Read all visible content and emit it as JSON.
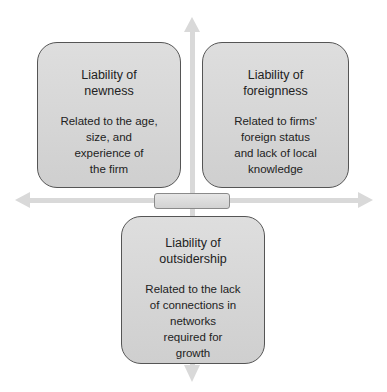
{
  "diagram": {
    "type": "quadrant-axes",
    "colors": {
      "axis": "#d9d9d9",
      "box_fill": "#d6d6d6",
      "box_border": "#555555"
    },
    "boxes": [
      {
        "position": "top-left",
        "title_lines": [
          "Liability of",
          "newness"
        ],
        "desc_lines": [
          "Related to the age,",
          "size, and",
          "experience of",
          "the firm"
        ]
      },
      {
        "position": "top-right",
        "title_lines": [
          "Liability of",
          "foreignness"
        ],
        "desc_lines": [
          "Related to firms'",
          "foreign status",
          "and lack of local",
          "knowledge"
        ]
      },
      {
        "position": "bottom",
        "title_lines": [
          "Liability of",
          "outsidership"
        ],
        "desc_lines": [
          "Related to the lack",
          "of connections in",
          "networks",
          "required for",
          "growth"
        ]
      }
    ]
  }
}
